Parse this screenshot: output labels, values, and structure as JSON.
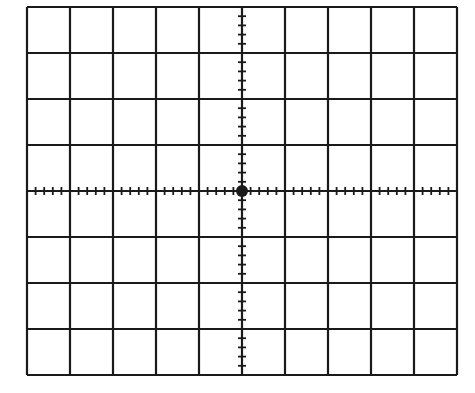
{
  "graticule": {
    "type": "oscilloscope-graticule",
    "columns": 10,
    "rows": 8,
    "minor_divisions_per_major": 5,
    "bounds": {
      "left": 27,
      "top": 7,
      "right": 457,
      "bottom": 375
    },
    "center": {
      "x": 243,
      "y": 191
    },
    "line_color": "#1a1a1a",
    "background": "#ffffff",
    "center_dot": true
  }
}
